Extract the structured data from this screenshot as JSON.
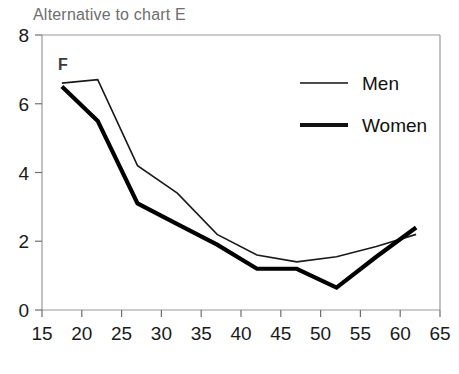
{
  "chart_data": {
    "type": "line",
    "title": "Alternative to  chart E",
    "panel_label": "F",
    "xlabel": "",
    "ylabel": "",
    "xlim": [
      15,
      65
    ],
    "ylim": [
      0,
      8
    ],
    "xticks": [
      15,
      20,
      25,
      30,
      35,
      40,
      45,
      50,
      55,
      60,
      65
    ],
    "xtick_labels": [
      "15",
      "20",
      "25",
      "30",
      "35",
      "40",
      "45",
      "50",
      "55",
      "60",
      "65"
    ],
    "yticks": [
      0,
      2,
      4,
      6,
      8
    ],
    "ytick_labels": [
      "0",
      "2",
      "4",
      "6",
      "8"
    ],
    "grid": false,
    "legend_position": "upper right",
    "series": [
      {
        "name": "Men",
        "line_width": "thin",
        "color": "#1a1a1a",
        "x": [
          17.5,
          22,
          27,
          32,
          37,
          42,
          47,
          52,
          57,
          62
        ],
        "y": [
          6.6,
          6.7,
          4.2,
          3.4,
          2.2,
          1.6,
          1.4,
          1.55,
          1.85,
          2.2
        ]
      },
      {
        "name": "Women",
        "line_width": "thick",
        "color": "#000000",
        "x": [
          17.5,
          22,
          27,
          32,
          37,
          42,
          47,
          52,
          57,
          62
        ],
        "y": [
          6.5,
          5.5,
          3.1,
          2.5,
          1.9,
          1.2,
          1.2,
          0.65,
          1.55,
          2.4
        ]
      }
    ],
    "legend_entries": [
      {
        "label": "Men",
        "line_width": "thin"
      },
      {
        "label": "Women",
        "line_width": "thick"
      }
    ]
  },
  "axes": {
    "frame_color": "#9a9a9a",
    "tick_color": "#6f6f6f"
  }
}
